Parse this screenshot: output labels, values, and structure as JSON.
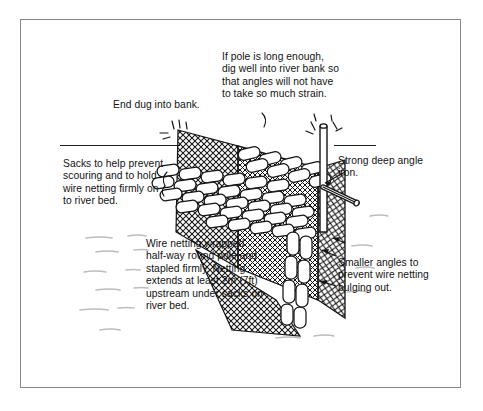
{
  "figure": {
    "kind": "line-drawing-diagram",
    "border_color": "#8a8a8a",
    "ink_color": "#121212",
    "water_mark_color": "#b9b9b9",
    "background": "#ffffff"
  },
  "labels": {
    "pole": "If pole is long enough, dig well into river bank so that angles will not have to take so much strain.",
    "bank_end": "End dug into bank.",
    "sacks": "Sacks to help prevent scouring and to hold wire netting firmly on to river bed.",
    "netting": "Wire netting wrapped half-way round pole and stapled firmly. Netting extends at least 2m (7ft) upstream under sacks on river bed.",
    "angle_iron": "Strong deep angle iron.",
    "smaller_angles": "Smaller angles to prevent wire netting bulging out."
  },
  "parts": {
    "waterline": "water-surface-line",
    "pole": "vertical-pole",
    "angle_iron": "strong-deep-angle-iron",
    "small_angles": "smaller-angle-irons",
    "mesh_bank": "wire-netting-bank-panel",
    "mesh_face": "wire-netting-face-panel",
    "mesh_side": "wire-netting-side-panel",
    "mesh_skirt": "wire-netting-bed-skirt",
    "sacks_diagonal": "sack-courses-diagonal",
    "sacks_upper": "sack-courses-upper",
    "sacks_column": "sack-column-vertical",
    "river_bed": "river-bed-flow-marks"
  },
  "measurements": {
    "netting_upstream_extent": "at least 2m (7ft)"
  }
}
